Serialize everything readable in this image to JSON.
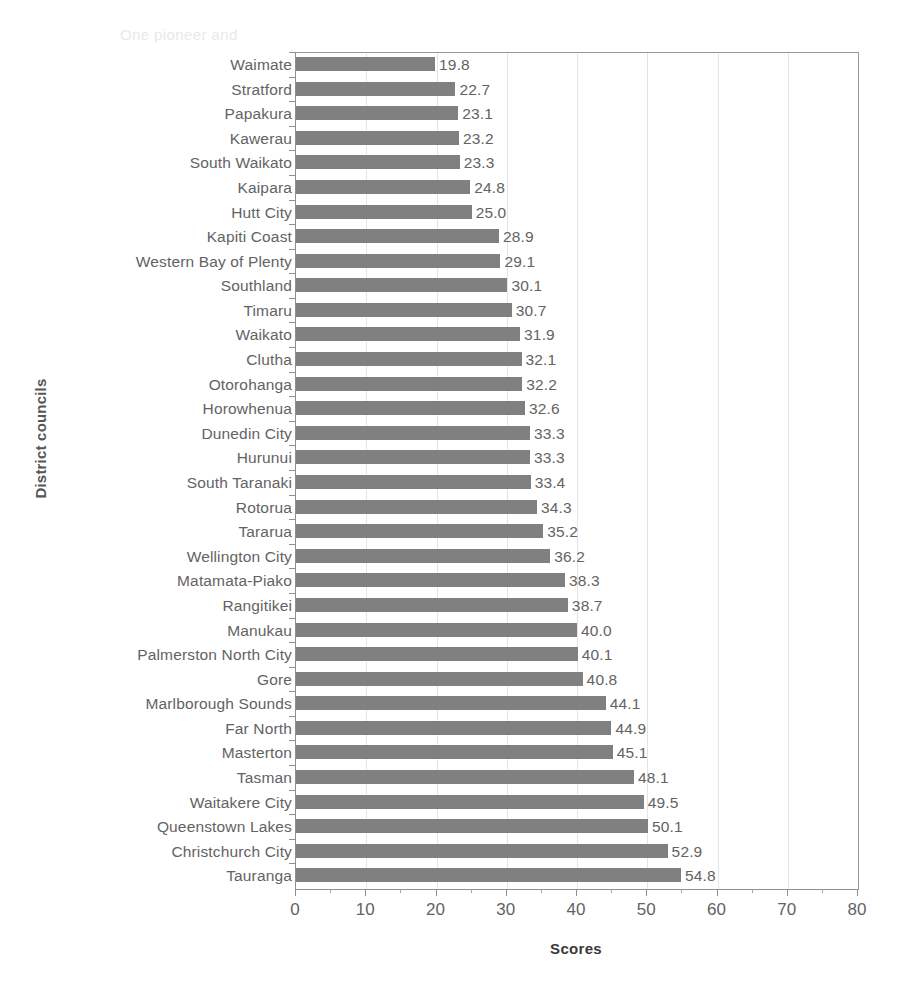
{
  "chart_data": {
    "type": "bar",
    "orientation": "horizontal",
    "title": "",
    "xlabel": "Scores",
    "ylabel": "District councils",
    "xlim": [
      0,
      80
    ],
    "xticks": [
      0,
      10,
      20,
      30,
      40,
      50,
      60,
      70,
      80
    ],
    "grid": "vertical-major",
    "legend": "none",
    "bar_color": "#808080",
    "value_labels": true,
    "categories": [
      "Waimate",
      "Stratford",
      "Papakura",
      "Kawerau",
      "South Waikato",
      "Kaipara",
      "Hutt City",
      "Kapiti Coast",
      "Western Bay of Plenty",
      "Southland",
      "Timaru",
      "Waikato",
      "Clutha",
      "Otorohanga",
      "Horowhenua",
      "Dunedin City",
      "Hurunui",
      "South Taranaki",
      "Rotorua",
      "Tararua",
      "Wellington City",
      "Matamata-Piako",
      "Rangitikei",
      "Manukau",
      "Palmerston North City",
      "Gore",
      "Marlborough Sounds",
      "Far North",
      "Masterton",
      "Tasman",
      "Waitakere City",
      "Queenstown Lakes",
      "Christchurch City",
      "Tauranga"
    ],
    "values": [
      19.8,
      22.7,
      23.1,
      23.2,
      23.3,
      24.8,
      25.0,
      28.9,
      29.1,
      30.1,
      30.7,
      31.9,
      32.1,
      32.2,
      32.6,
      33.3,
      33.3,
      33.4,
      34.3,
      35.2,
      36.2,
      38.3,
      38.7,
      40.0,
      40.1,
      40.8,
      44.1,
      44.9,
      45.1,
      48.1,
      49.5,
      50.1,
      52.9,
      54.8
    ],
    "value_label_text": [
      "19.8",
      "22.7",
      "23.1",
      "23.2",
      "23.3",
      "24.8",
      "25.0",
      "28.9",
      "29.1",
      "30.1",
      "30.7",
      "31.9",
      "32.1",
      "32.2",
      "32.6",
      "33.3",
      "33.3",
      "33.4",
      "34.3",
      "35.2",
      "36.2",
      "38.3",
      "38.7",
      "40.0",
      "40.1",
      "40.8",
      "44.1",
      "44.9",
      "45.1",
      "48.1",
      "49.5",
      "50.1",
      "52.9",
      "54.8"
    ],
    "xtick_labels": [
      "0",
      "10",
      "20",
      "30",
      "40",
      "50",
      "60",
      "70",
      "80"
    ]
  },
  "axes": {
    "x_title": "Scores",
    "y_title": "District councils"
  },
  "artifacts": {
    "bleed_top_1": "",
    "bleed_top_2": "One pioneer and",
    "bleed_top_3": ""
  }
}
